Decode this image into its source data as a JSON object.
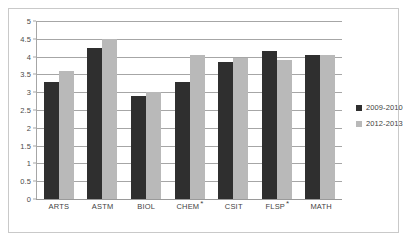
{
  "chart_data": {
    "type": "bar",
    "title": "",
    "subtitle": "",
    "xlabel": "",
    "ylabel": "",
    "categories": [
      "ARTS",
      "ASTM",
      "BIOL",
      "CHEM *",
      "CSIT",
      "FLSP *",
      "MATH"
    ],
    "series": [
      {
        "name": "2009-2010",
        "color": "#2f2f2f",
        "values": [
          3.3,
          4.25,
          2.9,
          3.3,
          3.85,
          4.15,
          4.05
        ]
      },
      {
        "name": "2012-2013",
        "color": "#b9b9b9",
        "values": [
          3.6,
          4.5,
          3.0,
          4.05,
          3.95,
          3.9,
          4.05
        ]
      }
    ],
    "ylim": [
      0,
      5
    ],
    "yticks": [
      "0",
      "0.5",
      "1",
      "1.5",
      "2",
      "2.5",
      "3",
      "3.5",
      "4",
      "4.5",
      "5"
    ],
    "ytick_values": [
      0,
      0.5,
      1,
      1.5,
      2,
      2.5,
      3,
      3.5,
      4,
      4.5,
      5
    ],
    "grid": true,
    "legend_position": "right"
  },
  "legend": {
    "entries": [
      {
        "label": "2009-2010"
      },
      {
        "label": "2012-2013"
      }
    ]
  }
}
